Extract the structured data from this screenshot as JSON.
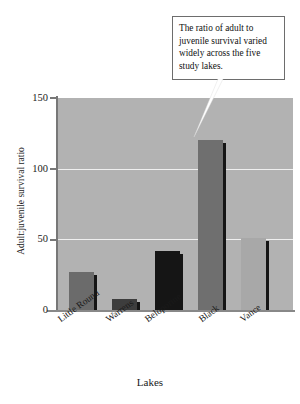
{
  "chart_data": {
    "type": "bar",
    "title": "",
    "xlabel": "Lakes",
    "ylabel": "Adult:juvenile survival ratio",
    "categories": [
      "Little Round",
      "Warrens",
      "Beloporine",
      "Black",
      "Vance"
    ],
    "values": [
      27,
      8,
      42,
      120,
      51
    ],
    "ylim": [
      0,
      150
    ],
    "yticks": [
      0,
      50,
      100,
      150
    ],
    "ytick_labels": [
      "0",
      "50",
      "100",
      "150"
    ],
    "grid": true,
    "gridlines_at": [
      50,
      100
    ],
    "legend": null,
    "legend_position": "none",
    "bar_colors": [
      "#6b6b6b",
      "#3d3d3d",
      "#151515",
      "#6f6f6f",
      "#a8a8a8"
    ],
    "plot_background": "#b2b2b2",
    "figure_background": "#ffffff",
    "gridline_color": "#efefef",
    "bar_shadow_color": "#151515",
    "annotations": [
      {
        "text": "The ratio of adult to juvenile survival varied widely across the five study lakes.",
        "points_to": "Black",
        "box_border": "#6d6d6d",
        "box_fill": "#ffffff"
      }
    ]
  },
  "annotation": {
    "callout_text": "The ratio of adult to juvenile survival varied widely across the five study lakes."
  },
  "axes": {
    "y_title": "Adult:juvenile survival ratio",
    "x_title": "Lakes",
    "ytick_0": "0",
    "ytick_50": "50",
    "ytick_100": "100",
    "ytick_150": "150"
  },
  "xticks": {
    "t0": "Little Round",
    "t1": "Warrens",
    "t2": "Beloporine",
    "t3": "Black",
    "t4": "Vance"
  }
}
